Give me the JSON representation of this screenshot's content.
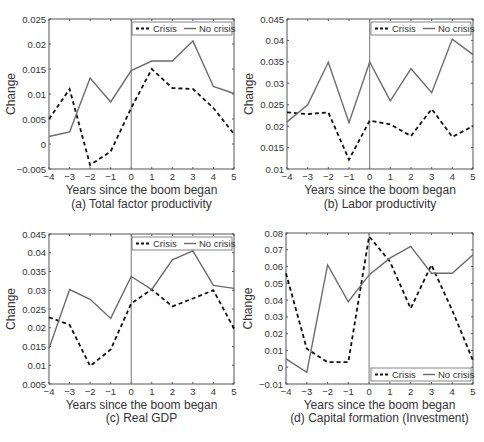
{
  "legend": {
    "crisis": "Crisis",
    "no_crisis": "No crisis"
  },
  "x_label": "Years since the boom began",
  "y_label": "Change",
  "bottom_caption": "",
  "colors": {
    "crisis": "#111111",
    "no_crisis": "#6b6b6b",
    "axis": "#555555"
  },
  "chart_data": [
    {
      "id": "a",
      "type": "line",
      "title": "(a) Total factor productivity",
      "xlabel": "Years since the boom began",
      "ylabel": "Change",
      "x": [
        -4,
        -3,
        -2,
        -1,
        0,
        1,
        2,
        3,
        4,
        5
      ],
      "xlim": [
        -4,
        5
      ],
      "ylim": [
        -0.005,
        0.025
      ],
      "yticks": [
        -0.005,
        0,
        0.005,
        0.01,
        0.015,
        0.02,
        0.025
      ],
      "ytick_labels": [
        "-0.005",
        "0",
        "0.005",
        "0.01",
        "0.015",
        "0.02",
        "0.025"
      ],
      "legend_position": "top-right",
      "vline_x": 0,
      "series": [
        {
          "name": "Crisis",
          "style": "dashed",
          "values": [
            0.005,
            0.011,
            -0.0042,
            -0.0015,
            0.0072,
            0.015,
            0.0112,
            0.011,
            0.0072,
            0.002
          ]
        },
        {
          "name": "No crisis",
          "style": "solid",
          "values": [
            0.0015,
            0.0024,
            0.0132,
            0.0084,
            0.0147,
            0.0166,
            0.0166,
            0.0206,
            0.0115,
            0.0101
          ]
        }
      ]
    },
    {
      "id": "b",
      "type": "line",
      "title": "(b) Labor productivity",
      "xlabel": "Years since the boom began",
      "ylabel": "Change",
      "x": [
        -4,
        -3,
        -2,
        -1,
        0,
        1,
        2,
        3,
        4,
        5
      ],
      "xlim": [
        -4,
        5
      ],
      "ylim": [
        0.01,
        0.045
      ],
      "yticks": [
        0.01,
        0.015,
        0.02,
        0.025,
        0.03,
        0.035,
        0.04,
        0.045
      ],
      "ytick_labels": [
        "0.01",
        "0.015",
        "0.02",
        "0.025",
        "0.03",
        "0.035",
        "0.04",
        "0.045"
      ],
      "legend_position": "top-right",
      "vline_x": 0,
      "series": [
        {
          "name": "Crisis",
          "style": "dashed",
          "values": [
            0.0232,
            0.0228,
            0.0232,
            0.0122,
            0.0213,
            0.0204,
            0.0177,
            0.024,
            0.0175,
            0.02
          ]
        },
        {
          "name": "No crisis",
          "style": "solid",
          "values": [
            0.021,
            0.025,
            0.0349,
            0.0208,
            0.035,
            0.0259,
            0.0334,
            0.0278,
            0.0403,
            0.0367
          ]
        }
      ]
    },
    {
      "id": "c",
      "type": "line",
      "title": "(c) Real GDP",
      "xlabel": "Years since the boom began",
      "ylabel": "Change",
      "x": [
        -4,
        -3,
        -2,
        -1,
        0,
        1,
        2,
        3,
        4,
        5
      ],
      "xlim": [
        -4,
        5
      ],
      "ylim": [
        0.005,
        0.045
      ],
      "yticks": [
        0.005,
        0.01,
        0.015,
        0.02,
        0.025,
        0.03,
        0.035,
        0.04,
        0.045
      ],
      "ytick_labels": [
        "0.005",
        "0.01",
        "0.015",
        "0.02",
        "0.025",
        "0.03",
        "0.035",
        "0.04",
        "0.045"
      ],
      "legend_position": "top-right",
      "vline_x": 0,
      "series": [
        {
          "name": "Crisis",
          "style": "dashed",
          "values": [
            0.0228,
            0.0208,
            0.0098,
            0.0142,
            0.0265,
            0.0302,
            0.0257,
            0.0278,
            0.03,
            0.0198
          ]
        },
        {
          "name": "No crisis",
          "style": "solid",
          "values": [
            0.0145,
            0.0302,
            0.0276,
            0.0225,
            0.0337,
            0.0302,
            0.0381,
            0.0405,
            0.0313,
            0.0305
          ]
        }
      ]
    },
    {
      "id": "d",
      "type": "line",
      "title": "(d) Capital formation (Investment)",
      "xlabel": "Years since the boom began",
      "ylabel": "Change",
      "x": [
        -4,
        -3,
        -2,
        -1,
        0,
        1,
        2,
        3,
        4,
        5
      ],
      "xlim": [
        -4,
        5
      ],
      "ylim": [
        -0.01,
        0.08
      ],
      "yticks": [
        -0.01,
        0,
        0.01,
        0.02,
        0.03,
        0.04,
        0.05,
        0.06,
        0.07,
        0.08
      ],
      "ytick_labels": [
        "-0.01",
        "0",
        "0.01",
        "0.02",
        "0.03",
        "0.04",
        "0.05",
        "0.06",
        "0.07",
        "0.08"
      ],
      "legend_position": "bottom-right",
      "vline_x": 0,
      "series": [
        {
          "name": "Crisis",
          "style": "dashed",
          "values": [
            0.056,
            0.011,
            0.003,
            0.003,
            0.078,
            0.063,
            0.035,
            0.061,
            0.034,
            0.004
          ]
        },
        {
          "name": "No crisis",
          "style": "solid",
          "values": [
            0.005,
            -0.003,
            0.061,
            0.039,
            0.055,
            0.065,
            0.072,
            0.056,
            0.056,
            0.067
          ]
        }
      ]
    }
  ],
  "layout": [
    {
      "plot": {
        "left": 49,
        "top": 19,
        "right": 234,
        "bottom": 169
      },
      "caption_top": 196
    },
    {
      "plot": {
        "left": 287,
        "top": 19,
        "right": 473,
        "bottom": 169
      },
      "caption_top": 196
    },
    {
      "plot": {
        "left": 49,
        "top": 234,
        "right": 234,
        "bottom": 384
      },
      "caption_top": 410
    },
    {
      "plot": {
        "left": 286,
        "top": 233,
        "right": 473,
        "bottom": 384
      },
      "caption_top": 410
    }
  ]
}
